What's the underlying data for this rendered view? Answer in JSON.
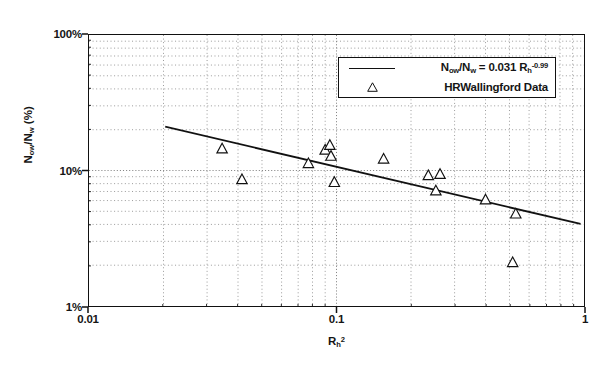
{
  "chart_data": {
    "type": "scatter",
    "title": "",
    "subtitle": "",
    "xlabel": "Rh2",
    "xlabel_base": "R",
    "xlabel_sub": "h",
    "xlabel_sup": "2",
    "ylabel": "Now/Nw (%)",
    "ylabel_base_1": "N",
    "ylabel_sub_1": "ow",
    "ylabel_base_2": "/N",
    "ylabel_sub_2": "w",
    "ylabel_units": " (%)",
    "xscale": "log",
    "yscale": "log",
    "xlim": [
      0.01,
      1
    ],
    "ylim": [
      1,
      100
    ],
    "xticks": [
      0.01,
      0.1,
      1
    ],
    "xtick_labels": [
      "0.01",
      "0.1",
      "1"
    ],
    "yticks": [
      1,
      10,
      100
    ],
    "ytick_labels": [
      "1%",
      "10%",
      "100%"
    ],
    "grid": "minor-dotted-both-axes",
    "legend_position": "top-right-inside",
    "series": [
      {
        "name": "fit-line",
        "type": "line",
        "label": "Now/Nw = 0.031 Rh^-0.99",
        "equation_lhs_base_1": "N",
        "equation_lhs_sub_1": "ow",
        "equation_lhs_base_2": "/N",
        "equation_lhs_sub_2": "w",
        "equation_eq": " = ",
        "equation_coeff": "0.031 ",
        "equation_var": "R",
        "equation_var_sub": "h",
        "equation_exp": "-0.99",
        "coefficient": 0.031,
        "exponent": -0.99,
        "x_start": 0.0205,
        "x_end": 0.96,
        "y_start": 21.0,
        "y_end": 4.05
      },
      {
        "name": "HRWallingford Data",
        "type": "scatter",
        "label": "HRWallingford Data",
        "marker": "triangle-up-open",
        "points": [
          [
            0.0345,
            14.5
          ],
          [
            0.0415,
            8.6
          ],
          [
            0.077,
            11.3
          ],
          [
            0.09,
            14.2
          ],
          [
            0.094,
            15.4
          ],
          [
            0.095,
            12.8
          ],
          [
            0.098,
            8.2
          ],
          [
            0.155,
            12.2
          ],
          [
            0.235,
            9.2
          ],
          [
            0.262,
            9.4
          ],
          [
            0.252,
            7.1
          ],
          [
            0.4,
            6.1
          ],
          [
            0.53,
            4.8
          ],
          [
            0.515,
            2.1
          ]
        ]
      }
    ]
  }
}
